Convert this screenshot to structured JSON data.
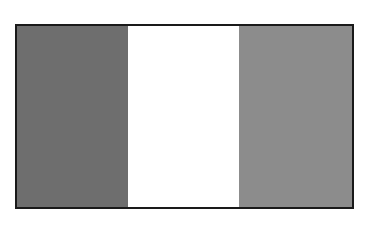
{
  "figure": {
    "type": "tricolor-vertical-flag",
    "border_color": "#1a1a1a",
    "stripes": [
      {
        "position": "left",
        "color": "#6e6e6e"
      },
      {
        "position": "middle",
        "color": "#ffffff"
      },
      {
        "position": "right",
        "color": "#8c8c8c"
      }
    ]
  }
}
